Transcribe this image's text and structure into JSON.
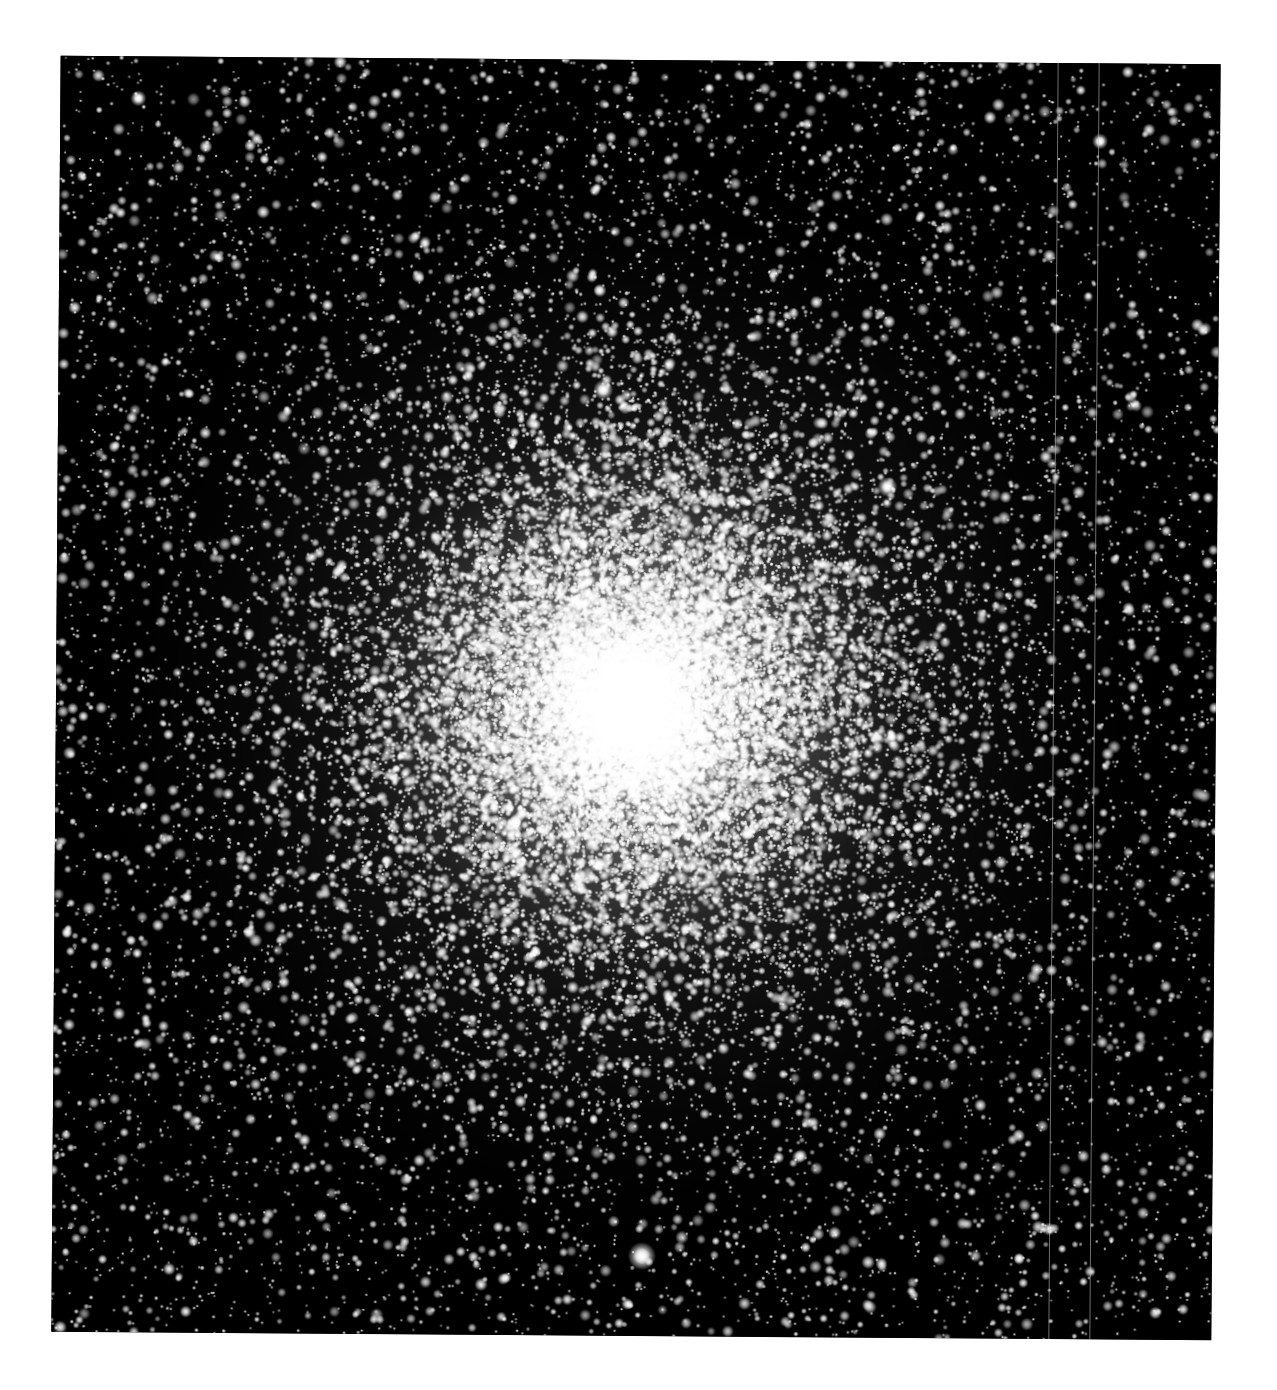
{
  "image": {
    "subject": "globular star cluster",
    "description": "Dense globular cluster of stars with a bright saturated core, black sky background, grayscale",
    "background_page_color": "#ffffff",
    "sky_color": "#000000",
    "star_color": "#ffffff"
  },
  "frame": {
    "left": 56,
    "top": 60,
    "width": 1160,
    "height": 1276,
    "rotation_deg": 0.42
  },
  "cluster": {
    "core_x": 575,
    "core_y": 645,
    "core_radius": 60,
    "halo_radius": 560,
    "field_star_count": 9000,
    "cluster_star_count": 26000
  },
  "bright_stars": [
    {
      "name": "bright-star-bottom",
      "x": 590,
      "y": 1196,
      "r": 7
    },
    {
      "name": "bright-star-upper",
      "x": 545,
      "y": 330,
      "r": 5
    },
    {
      "name": "bright-star-right",
      "x": 830,
      "y": 425,
      "r": 5
    },
    {
      "name": "bright-star-topleft",
      "x": 78,
      "y": 42,
      "r": 4
    },
    {
      "name": "bright-star-topright",
      "x": 1040,
      "y": 78,
      "r": 4
    }
  ],
  "artifact_lines": [
    {
      "name": "detector-line-1",
      "x": 997
    },
    {
      "name": "detector-line-2",
      "x": 1038
    }
  ]
}
